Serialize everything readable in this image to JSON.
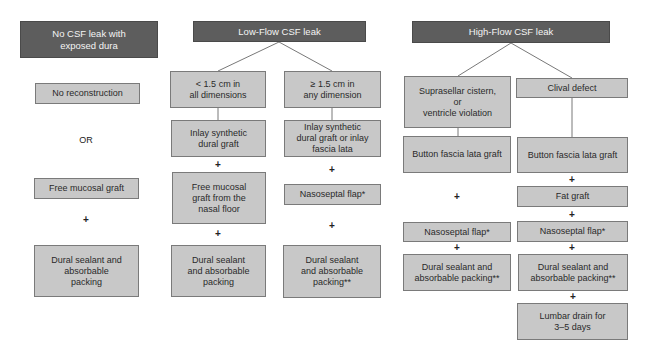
{
  "columns": {
    "no_leak": {
      "header": "No CSF leak with\nexposed dura",
      "option_a": "No reconstruction",
      "connector_or": "OR",
      "option_b": "Free mucosal graft",
      "plus": "+",
      "sealant": "Dural sealant and\nabsorbable\npacking"
    },
    "low_flow": {
      "header": "Low-Flow CSF leak",
      "small": {
        "criteria": "< 1.5 cm in\nall dimensions",
        "step1": "Inlay synthetic\ndural graft",
        "plus1": "+",
        "step2": "Free mucosal\ngraft from the\nnasal floor",
        "plus2": "+",
        "step3": "Dural sealant\nand absorbable\npacking"
      },
      "large": {
        "criteria": "≥ 1.5 cm in\nany dimension",
        "step1": "Inlay synthetic\ndural graft or inlay\nfascia lata",
        "plus1": "+",
        "step2": "Nasoseptal flap*",
        "plus2": "+",
        "step3": "Dural sealant\nand absorbable\npacking**"
      }
    },
    "high_flow": {
      "header": "High-Flow CSF leak",
      "suprasellar": {
        "criteria": "Suprasellar cistern,\nor\nventricle violation",
        "step1": "Button fascia lata graft",
        "plus1": "+",
        "step2": "Nasoseptal flap*",
        "plus2": "+",
        "step3": "Dural sealant and\nabsorbable packing**"
      },
      "clival": {
        "criteria": "Clival defect",
        "step1": "Button fascia lata graft",
        "plus1": "+",
        "step2": "Fat graft",
        "plus2": "+",
        "step3": "Nasoseptal flap*",
        "plus3": "+",
        "step4": "Dural sealant and\nabsorbable packing**",
        "plus4": "+",
        "step5": "Lumbar drain for\n3–5 days"
      }
    }
  },
  "colors": {
    "header_fill": "#5d5d5d",
    "node_fill": "#c8c8c8",
    "border": "#7a7a7a",
    "line": "#555555"
  }
}
